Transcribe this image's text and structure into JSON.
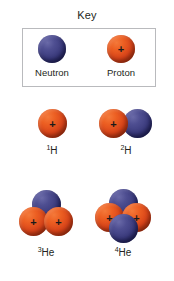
{
  "figure": {
    "title": "Key",
    "background_color": "#ffffff"
  },
  "colors": {
    "proton": "#d9441a",
    "neutron": "#3b3b7d",
    "key_box_border": "#b9babd",
    "text": "#231f20"
  },
  "key": {
    "title": "Key",
    "entries": [
      {
        "label": "Neutron",
        "particle": "neutron",
        "charge_symbol": ""
      },
      {
        "label": "Proton",
        "particle": "proton",
        "charge_symbol": "+"
      }
    ]
  },
  "nuclei": [
    {
      "id": "hydrogen-1",
      "label_sup": "1",
      "label_main": "H",
      "label_text": "1H",
      "protons": 1,
      "neutrons": 0,
      "particles": [
        {
          "type": "proton",
          "charge_symbol": "+"
        }
      ]
    },
    {
      "id": "hydrogen-2",
      "label_sup": "2",
      "label_main": "H",
      "label_text": "2H",
      "protons": 1,
      "neutrons": 1,
      "particles": [
        {
          "type": "proton",
          "charge_symbol": "+"
        },
        {
          "type": "neutron",
          "charge_symbol": ""
        }
      ]
    },
    {
      "id": "helium-3",
      "label_sup": "3",
      "label_main": "He",
      "label_text": "3He",
      "protons": 2,
      "neutrons": 1,
      "particles": [
        {
          "type": "neutron",
          "charge_symbol": ""
        },
        {
          "type": "proton",
          "charge_symbol": "+"
        },
        {
          "type": "proton",
          "charge_symbol": "+"
        }
      ]
    },
    {
      "id": "helium-4",
      "label_sup": "4",
      "label_main": "He",
      "label_text": "4He",
      "protons": 2,
      "neutrons": 2,
      "particles": [
        {
          "type": "neutron",
          "charge_symbol": ""
        },
        {
          "type": "proton",
          "charge_symbol": "+"
        },
        {
          "type": "proton",
          "charge_symbol": "+"
        },
        {
          "type": "neutron",
          "charge_symbol": ""
        }
      ]
    }
  ]
}
